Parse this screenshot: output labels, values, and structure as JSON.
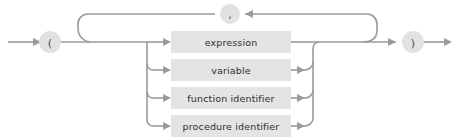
{
  "diagram": {
    "type": "railroad-syntax-diagram",
    "name": "actual parameter list",
    "background_color": "#ffffff",
    "rail_color": "#9a9a9a",
    "terminal_fill": "#e2e2e2",
    "nonterminal_fill": "#e4e4e4",
    "nonterminal_text_color": "#2e2e2e",
    "terminal_text_color": "#4a4a4a",
    "terminals": [
      {
        "id": "open-paren",
        "label": "(",
        "cx": 50,
        "cy": 42,
        "r": 11
      },
      {
        "id": "comma",
        "label": ",",
        "cx": 230,
        "cy": 14,
        "r": 10
      },
      {
        "id": "close-paren",
        "label": ")",
        "cx": 413,
        "cy": 42,
        "r": 11
      }
    ],
    "nonterminals": [
      {
        "id": "expression",
        "label": "expression",
        "x": 171,
        "y": 31,
        "w": 120,
        "h": 22
      },
      {
        "id": "variable",
        "label": "variable",
        "x": 171,
        "y": 59,
        "w": 120,
        "h": 22
      },
      {
        "id": "function-identifier",
        "label": "function identifier",
        "x": 171,
        "y": 87,
        "w": 120,
        "h": 22
      },
      {
        "id": "procedure-identifier",
        "label": "procedure identifier",
        "x": 171,
        "y": 115,
        "w": 120,
        "h": 22
      }
    ],
    "rows_y": [
      42,
      70,
      98,
      126
    ],
    "fanout_x": 147,
    "merge_x": 313,
    "loop_left_x": 90,
    "loop_right_x": 377,
    "loop_top_y": 14,
    "main_y": 42,
    "entry_arrow_x": 10,
    "exit_arrow_x": 452
  }
}
